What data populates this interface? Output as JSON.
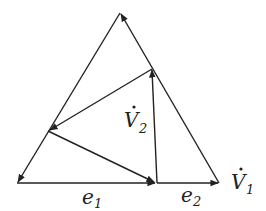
{
  "diagram": {
    "type": "vector-triangle",
    "colors": {
      "stroke": "#222222",
      "background": "#ffffff"
    },
    "labels": {
      "e1": "e",
      "e1_sub": "1",
      "e2": "e",
      "e2_sub": "2",
      "v1": "V",
      "v1_sub": "1",
      "v1_dot": "·",
      "v2": "V",
      "v2_sub": "2",
      "v2_dot": "·"
    }
  }
}
